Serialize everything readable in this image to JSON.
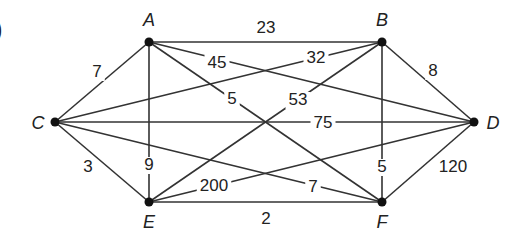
{
  "fragment": ")",
  "nodes": [
    {
      "id": "A",
      "label": "A",
      "x": 149,
      "y": 42,
      "lx": 149,
      "ly": 26
    },
    {
      "id": "B",
      "label": "B",
      "x": 382,
      "y": 42,
      "lx": 382,
      "ly": 26
    },
    {
      "id": "C",
      "label": "C",
      "x": 55,
      "y": 122,
      "lx": 38,
      "ly": 129
    },
    {
      "id": "D",
      "label": "D",
      "x": 474,
      "y": 122,
      "lx": 493,
      "ly": 129
    },
    {
      "id": "E",
      "label": "E",
      "x": 149,
      "y": 202,
      "lx": 149,
      "ly": 228
    },
    {
      "id": "F",
      "label": "F",
      "x": 382,
      "y": 202,
      "lx": 382,
      "ly": 228
    }
  ],
  "edges": [
    {
      "from": "A",
      "to": "B",
      "weight": "23",
      "lx": 266,
      "ly": 33
    },
    {
      "from": "A",
      "to": "D",
      "weight": "45",
      "lx": 217,
      "ly": 68
    },
    {
      "from": "A",
      "to": "F",
      "weight": "5",
      "lx": 232,
      "ly": 104
    },
    {
      "from": "A",
      "to": "C",
      "weight": "7",
      "lx": 97,
      "ly": 77
    },
    {
      "from": "A",
      "to": "E",
      "weight": "9",
      "lx": 149,
      "ly": 170
    },
    {
      "from": "B",
      "to": "C",
      "weight": "32",
      "lx": 316,
      "ly": 63
    },
    {
      "from": "B",
      "to": "E",
      "weight": "53",
      "lx": 298,
      "ly": 105
    },
    {
      "from": "B",
      "to": "D",
      "weight": "8",
      "lx": 433,
      "ly": 76
    },
    {
      "from": "B",
      "to": "F",
      "weight": "5",
      "lx": 382,
      "ly": 172
    },
    {
      "from": "C",
      "to": "D",
      "weight": "75",
      "lx": 323,
      "ly": 128
    },
    {
      "from": "C",
      "to": "E",
      "weight": "3",
      "lx": 88,
      "ly": 172
    },
    {
      "from": "C",
      "to": "F",
      "weight": "7",
      "lx": 313,
      "ly": 192
    },
    {
      "from": "E",
      "to": "D",
      "weight": "200",
      "lx": 214,
      "ly": 191
    },
    {
      "from": "E",
      "to": "F",
      "weight": "2",
      "lx": 266,
      "ly": 224
    },
    {
      "from": "F",
      "to": "D",
      "weight": "120",
      "lx": 453,
      "ly": 172
    }
  ]
}
